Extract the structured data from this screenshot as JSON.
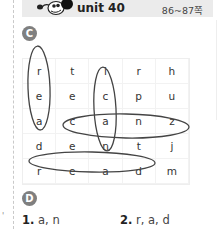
{
  "header": {
    "mascot_icon": "cartoon-mascot-icon",
    "unit_title": "unit 40",
    "pages": "86~87쪽",
    "background_color": "#ebebeb"
  },
  "section_c": {
    "badge": "C",
    "badge_color": "#7f7f7f",
    "grid": [
      [
        "r",
        "t",
        "i",
        "r",
        "h"
      ],
      [
        "e",
        "e",
        "c",
        "p",
        "u"
      ],
      [
        "a",
        "c",
        "a",
        "n",
        "z"
      ],
      [
        "d",
        "e",
        "n",
        "t",
        "j"
      ],
      [
        "r",
        "e",
        "a",
        "d",
        "m"
      ]
    ],
    "circled_words": [
      "read (column 1, vertical)",
      "can (column 3, vertical)",
      "can (row 3, horizontal)",
      "read (row 5, horizontal)"
    ]
  },
  "section_d": {
    "badge": "D",
    "answers": [
      {
        "number": "1.",
        "text": "a, n"
      },
      {
        "number": "2.",
        "text": "r, a, d"
      }
    ]
  },
  "margin_mark": "'"
}
